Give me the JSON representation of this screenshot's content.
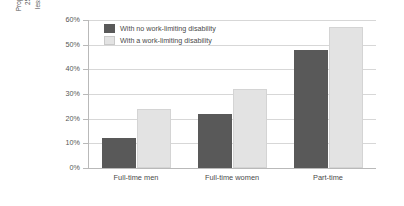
{
  "chart_data": {
    "type": "bar",
    "title": "",
    "subtitle": "",
    "xlabel": "",
    "ylabel": "Proportion of employees aged 25 to retirement who earn less than £6.50 per hour (%)",
    "ylabel_lines": [
      "Proportion of employees aged",
      "25 to retirement who earn",
      "less than £6.50 per hour (%)"
    ],
    "categories": [
      "Full-time men",
      "Full-time women",
      "Part-time"
    ],
    "series": [
      {
        "name": "With no work-limiting disability",
        "color": "#595959",
        "values": [
          12,
          22,
          48
        ]
      },
      {
        "name": "With a work-limiting disability",
        "color": "#e3e3e3",
        "values": [
          24,
          32,
          57
        ]
      }
    ],
    "ylim": [
      0,
      60
    ],
    "y_ticks": [
      0,
      10,
      20,
      30,
      40,
      50,
      60
    ],
    "y_tick_labels": [
      "0%",
      "10%",
      "20%",
      "30%",
      "40%",
      "50%",
      "60%"
    ],
    "grid": true,
    "grid_axis": "y",
    "legend_position": "top-left"
  },
  "colors": {
    "series_dark": "#595959",
    "series_light": "#e3e3e3",
    "gridline": "#d7d7d7",
    "axis": "#b9b9b9",
    "text": "#4a4a4a"
  }
}
